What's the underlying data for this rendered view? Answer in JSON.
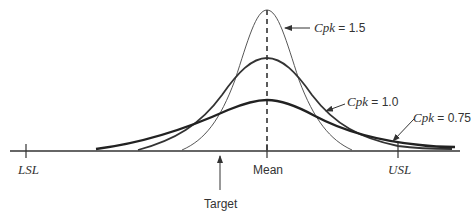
{
  "diagram": {
    "axis": {
      "labels": {
        "lsl": "LSL",
        "mean": "Mean",
        "usl": "USL",
        "target": "Target"
      }
    },
    "curves": [
      {
        "name": "Cpk = 1.5",
        "cpk_symbol": "Cpk",
        "value_text": " = 1.5",
        "shape": "narrow, tallest",
        "stroke": "thin"
      },
      {
        "name": "Cpk = 1.0",
        "cpk_symbol": "Cpk",
        "value_text": " = 1.0",
        "shape": "medium",
        "stroke": "thick"
      },
      {
        "name": "Cpk = 0.75",
        "cpk_symbol": "Cpk",
        "value_text": " = 0.75",
        "shape": "wide, flattest",
        "stroke": "thickest"
      }
    ],
    "colors": {
      "line": "#333333",
      "background": "#ffffff"
    }
  }
}
